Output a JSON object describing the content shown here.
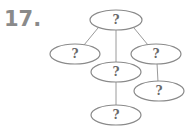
{
  "problem_number": "17.",
  "diagram": {
    "type": "tree",
    "nodes": [
      {
        "id": "root",
        "label": "?",
        "cx": 116,
        "cy": 20
      },
      {
        "id": "left",
        "label": "?",
        "cx": 75,
        "cy": 54
      },
      {
        "id": "right",
        "label": "?",
        "cx": 156,
        "cy": 54
      },
      {
        "id": "middle",
        "label": "?",
        "cx": 116,
        "cy": 72
      },
      {
        "id": "right-child",
        "label": "?",
        "cx": 159,
        "cy": 91
      },
      {
        "id": "bottom",
        "label": "?",
        "cx": 116,
        "cy": 115
      }
    ],
    "edges": [
      [
        "root",
        "left"
      ],
      [
        "root",
        "middle"
      ],
      [
        "root",
        "right"
      ],
      [
        "middle",
        "bottom"
      ],
      [
        "right",
        "right-child"
      ]
    ]
  }
}
